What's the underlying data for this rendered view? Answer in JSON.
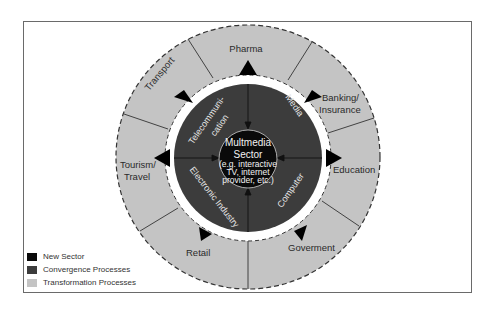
{
  "diagram": {
    "center": {
      "title_line1": "Multmedia",
      "title_line2": "Sector",
      "sub_line1": "(e.g. interactive",
      "sub_line2": "TV, internet",
      "sub_line3": "provider, etc.)"
    },
    "convergence_sectors": {
      "telecom_line1": "Telecommuni-",
      "telecom_line2": "cation",
      "media": "Media",
      "computer": "Computer",
      "electronic": "Electronic Industry"
    },
    "transformation_sectors": {
      "pharma": "Pharma",
      "banking_line1": "Banking/",
      "banking_line2": "Insurance",
      "education": "Education",
      "government": "Goverment",
      "retail": "Retail",
      "tourism_line1": "Tourism/",
      "tourism_line2": "Travel",
      "transport": "Transport"
    },
    "colors": {
      "new_sector": "#0a0a0a",
      "convergence": "#3c3c3c",
      "transformation": "#c4c4c4",
      "separator": "#ffffff"
    }
  },
  "legend": {
    "items": [
      {
        "label": "New Sector",
        "color": "#0a0a0a"
      },
      {
        "label": "Convergence Processes",
        "color": "#3c3c3c"
      },
      {
        "label": "Transformation Processes",
        "color": "#c4c4c4"
      }
    ]
  }
}
